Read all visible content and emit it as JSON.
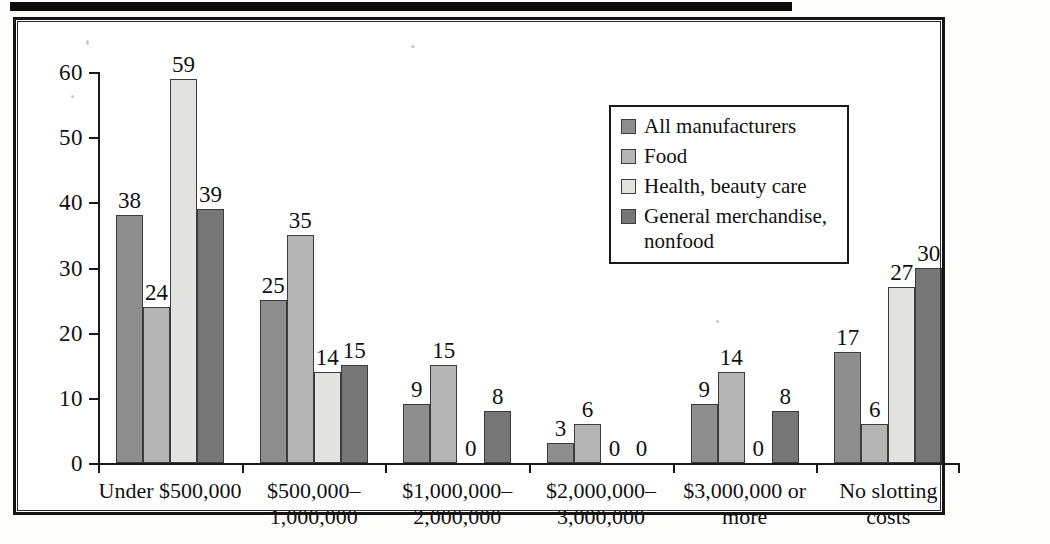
{
  "figure": {
    "frame_border_color": "#141414",
    "background_color": "#ffffff"
  },
  "legend": {
    "position": "inside-top-right",
    "entries": [
      {
        "label": "All manufacturers",
        "color": "#8e8e8e"
      },
      {
        "label": "Food",
        "color": "#b5b5b5"
      },
      {
        "label": "Health, beauty care",
        "color": "#e2e2e0"
      },
      {
        "label": "General merchandise,\nnonfood",
        "color": "#767676"
      }
    ]
  },
  "axes": {
    "y_ticks": [
      "0",
      "10",
      "20",
      "30",
      "40",
      "50",
      "60"
    ],
    "y_values": [
      0,
      10,
      20,
      30,
      40,
      50,
      60
    ]
  },
  "chart_data": {
    "type": "bar",
    "title": "",
    "subtitle": "",
    "xlabel": "",
    "ylabel": "",
    "ylim": [
      0,
      60
    ],
    "grid": false,
    "legend_position": "inside-top-right",
    "categories": [
      "Under $500,000",
      "$500,000–\n1,000,000",
      "$1,000,000–\n2,000,000",
      "$2,000,000–\n3,000,000",
      "$3,000,000 or\nmore",
      "No slotting\ncosts"
    ],
    "series": [
      {
        "name": "All manufacturers",
        "color": "#8e8e8e",
        "values": [
          38,
          25,
          9,
          3,
          9,
          17
        ]
      },
      {
        "name": "Food",
        "color": "#b5b5b5",
        "values": [
          24,
          35,
          15,
          6,
          14,
          6
        ]
      },
      {
        "name": "Health, beauty care",
        "color": "#e2e2e0",
        "values": [
          59,
          14,
          0,
          0,
          0,
          27
        ]
      },
      {
        "name": "General merchandise, nonfood",
        "color": "#767676",
        "values": [
          39,
          15,
          8,
          0,
          8,
          30
        ]
      }
    ],
    "data_labels": [
      [
        "38",
        "24",
        "59",
        "39"
      ],
      [
        "25",
        "35",
        "14",
        "15"
      ],
      [
        "9",
        "15",
        "0",
        "8"
      ],
      [
        "3",
        "6",
        "0",
        "0"
      ],
      [
        "9",
        "14",
        "0",
        "8"
      ],
      [
        "17",
        "6",
        "27",
        "30"
      ]
    ]
  }
}
